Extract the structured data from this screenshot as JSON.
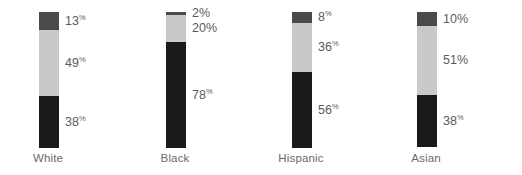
{
  "chart_data": {
    "type": "bar",
    "subtype": "stacked-bar-100pct",
    "title": "",
    "subtitle": "",
    "xlabel": "",
    "ylabel": "",
    "ylim": [
      0,
      100
    ],
    "grid": false,
    "legend": "none",
    "orientation": "vertical",
    "stack_order_top_to_bottom": [
      "top",
      "middle",
      "bottom"
    ],
    "categories": [
      "White",
      "Black",
      "Hispanic",
      "Asian"
    ],
    "series": [
      {
        "name": "top",
        "color": "#4a4a4a",
        "values": [
          13,
          2,
          8,
          10
        ]
      },
      {
        "name": "middle",
        "color": "#c9c9c9",
        "values": [
          49,
          20,
          36,
          51
        ]
      },
      {
        "name": "bottom",
        "color": "#1a1a1a",
        "values": [
          38,
          78,
          56,
          38
        ]
      }
    ],
    "value_label_suffix": "%"
  },
  "colors": {
    "background": "#ffffff",
    "segment_top": "#4a4a4a",
    "segment_middle": "#c9c9c9",
    "segment_bottom": "#1a1a1a",
    "value_label": "#5b5b5b",
    "category_label": "#6a6a6a"
  },
  "bars": [
    {
      "category": "White",
      "segments": [
        {
          "key": "top",
          "value": 13,
          "value_text": "13",
          "suffix": "%"
        },
        {
          "key": "middle",
          "value": 49,
          "value_text": "49",
          "suffix": "%"
        },
        {
          "key": "bottom",
          "value": 38,
          "value_text": "38",
          "suffix": "%"
        }
      ]
    },
    {
      "category": "Black",
      "segments": [
        {
          "key": "top",
          "value": 2,
          "value_text": "2",
          "suffix": "%"
        },
        {
          "key": "middle",
          "value": 20,
          "value_text": "20",
          "suffix": "%"
        },
        {
          "key": "bottom",
          "value": 78,
          "value_text": "78",
          "suffix": "%"
        }
      ]
    },
    {
      "category": "Hispanic",
      "segments": [
        {
          "key": "top",
          "value": 8,
          "value_text": "8",
          "suffix": "%"
        },
        {
          "key": "middle",
          "value": 36,
          "value_text": "36",
          "suffix": "%"
        },
        {
          "key": "bottom",
          "value": 56,
          "value_text": "56",
          "suffix": "%"
        }
      ]
    },
    {
      "category": "Asian",
      "segments": [
        {
          "key": "top",
          "value": 10,
          "value_text": "10",
          "suffix": "%"
        },
        {
          "key": "middle",
          "value": 51,
          "value_text": "51",
          "suffix": "%"
        },
        {
          "key": "bottom",
          "value": 38,
          "value_text": "38",
          "suffix": "%"
        }
      ]
    }
  ],
  "layout": {
    "bar_left_offsets": [
      39,
      166,
      292,
      417
    ],
    "bar_width": 20,
    "bar_top": 12,
    "bar_height": 136,
    "label_offsets": [
      38,
      165,
      291,
      416
    ],
    "big_pct_label_bars": [
      1,
      3
    ]
  }
}
